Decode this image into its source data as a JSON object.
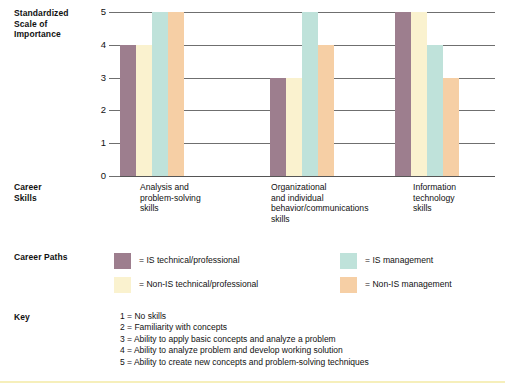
{
  "labels": {
    "axis_title": "Standardized\nScale of\nImportance",
    "career_skills": "Career\nSkills",
    "career_paths": "Career Paths",
    "key": "Key"
  },
  "chart_data": {
    "type": "bar",
    "title": "",
    "xlabel": "Career Skills",
    "ylabel": "Standardized Scale of Importance",
    "ylim": [
      0,
      5
    ],
    "yticks": [
      "0",
      "1",
      "2",
      "3",
      "4",
      "5"
    ],
    "grid": true,
    "legend_position": "below",
    "categories": [
      "Analysis and problem-solving skills",
      "Organizational and individual behavior/communications skills",
      "Information technology skills"
    ],
    "category_label_lines": [
      [
        "Analysis and",
        "problem-solving",
        "skills"
      ],
      [
        "Organizational",
        "and individual",
        "behavior/communications",
        "skills"
      ],
      [
        "Information",
        "technology",
        "skills"
      ]
    ],
    "series": [
      {
        "name": "IS technical/professional",
        "color": "#9d7e8e",
        "values": [
          4,
          3,
          5
        ]
      },
      {
        "name": "Non-IS technical/professional",
        "color": "#faf2cf",
        "values": [
          4,
          3,
          5
        ]
      },
      {
        "name": "IS management",
        "color": "#bfe2da",
        "values": [
          5,
          5,
          4
        ]
      },
      {
        "name": "Non-IS management",
        "color": "#f6cfa5",
        "values": [
          5,
          4,
          3
        ]
      }
    ]
  },
  "legend": [
    {
      "label": "= IS technical/professional",
      "color": "#9d7e8e"
    },
    {
      "label": "= Non-IS technical/professional",
      "color": "#faf2cf"
    },
    {
      "label": "= IS management",
      "color": "#bfe2da"
    },
    {
      "label": "= Non-IS management",
      "color": "#f6cfa5"
    }
  ],
  "key_items": [
    "1 = No skills",
    "2 = Familiarity with concepts",
    "3 = Ability to apply basic concepts and analyze a problem",
    "4 = Ability to analyze problem and develop working solution",
    "5 = Ability to create new concepts and problem-solving techniques"
  ]
}
